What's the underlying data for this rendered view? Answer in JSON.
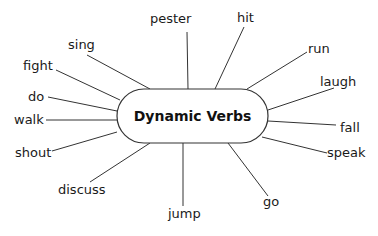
{
  "diagram": {
    "center": {
      "label": "Dynamic Verbs",
      "box": {
        "x": 117,
        "y": 89,
        "width": 151,
        "height": 54,
        "radius": 27
      }
    },
    "spokes": [
      {
        "label": "pester",
        "text": {
          "x": 150,
          "y": 23
        },
        "line": [
          187,
          32,
          188,
          89
        ]
      },
      {
        "label": "hit",
        "text": {
          "x": 237,
          "y": 22
        },
        "line": [
          244,
          27,
          215,
          89
        ]
      },
      {
        "label": "run",
        "text": {
          "x": 308,
          "y": 53
        },
        "line": [
          307,
          52,
          247,
          89
        ]
      },
      {
        "label": "laugh",
        "text": {
          "x": 320,
          "y": 86
        },
        "line": [
          334,
          88,
          268,
          110
        ]
      },
      {
        "label": "fall",
        "text": {
          "x": 340,
          "y": 132
        },
        "line": [
          336,
          125,
          268,
          121
        ]
      },
      {
        "label": "speak",
        "text": {
          "x": 327,
          "y": 157
        },
        "line": [
          327,
          153,
          262,
          137
        ]
      },
      {
        "label": "go",
        "text": {
          "x": 263,
          "y": 206
        },
        "line": [
          268,
          196,
          228,
          143
        ]
      },
      {
        "label": "jump",
        "text": {
          "x": 168,
          "y": 218
        },
        "line": [
          183,
          206,
          183,
          143
        ]
      },
      {
        "label": "discuss",
        "text": {
          "x": 58,
          "y": 194
        },
        "line": [
          90,
          182,
          150,
          143
        ]
      },
      {
        "label": "shout",
        "text": {
          "x": 15,
          "y": 157
        },
        "line": [
          52,
          151,
          117,
          132
        ]
      },
      {
        "label": "walk",
        "text": {
          "x": 14,
          "y": 124
        },
        "line": [
          46,
          120,
          117,
          120
        ]
      },
      {
        "label": "do",
        "text": {
          "x": 28,
          "y": 101
        },
        "line": [
          48,
          97,
          117,
          111
        ]
      },
      {
        "label": "fight",
        "text": {
          "x": 23,
          "y": 70
        },
        "line": [
          56,
          70,
          120,
          100
        ]
      },
      {
        "label": "sing",
        "text": {
          "x": 68,
          "y": 49
        },
        "line": [
          87,
          55,
          150,
          89
        ]
      }
    ]
  }
}
